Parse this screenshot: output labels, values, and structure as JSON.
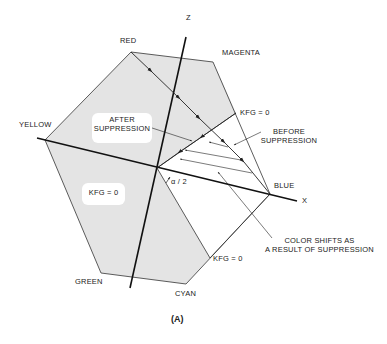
{
  "diagram": {
    "caption": "(A)",
    "axes": {
      "z_label": "Z",
      "x_label": "X",
      "angle_label": "α / 2"
    },
    "vertices": {
      "red": "RED",
      "magenta": "MAGENTA",
      "yellow": "YELLOW",
      "blue": "BLUE",
      "green": "GREEN",
      "cyan": "CYAN"
    },
    "annotations": {
      "after_line1": "AFTER",
      "after_line2": "SUPPRESSION",
      "before_line1": "BEFORE",
      "before_line2": "SUPPRESSION",
      "kfg_top": "KFG = 0",
      "kfg_left": "KFG = 0",
      "kfg_bottom": "KFG = 0",
      "shifts_line1": "COLOR SHIFTS AS",
      "shifts_line2": "A RESULT OF SUPPRESSION"
    },
    "colors": {
      "fill": "#e4e4e4",
      "line": "#222222",
      "background": "#ffffff"
    }
  }
}
